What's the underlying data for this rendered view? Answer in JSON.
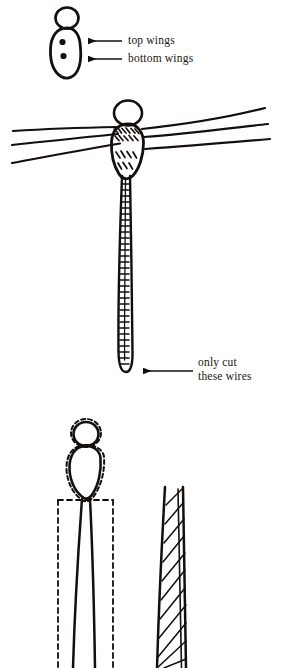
{
  "document": {
    "type": "hand-drawn instructional diagram",
    "background_color": "#ffffff",
    "ink_color": "#140f0c",
    "width": 283,
    "height": 668
  },
  "annotations": {
    "top_wings": {
      "text": "top wings",
      "arrow": "leftward-arrow-icon",
      "points_to": "upper dot on insect body"
    },
    "bottom_wings": {
      "text": "bottom wings",
      "arrow": "leftward-arrow-icon",
      "points_to": "lower dot on insect body"
    },
    "only_cut": {
      "line1": "only cut",
      "line2": "these wires",
      "arrow": "leftward-arrow-icon",
      "points_to": "bottom tip of the wrapped wire tail"
    }
  },
  "figures": [
    {
      "name": "figure-1-body-plan",
      "description": "Small insect body outline: round head above an elongated teardrop body containing two filled dots marking the top wing and bottom wing attachment points.",
      "parts": [
        "head-circle",
        "body-teardrop",
        "top-wing-dot",
        "bottom-wing-dot"
      ]
    },
    {
      "name": "figure-2-assembled-insect",
      "description": "Assembled figure: round head, body with hatched wire crossings, three long wires passing through on each side forming wings, and a long wrapped wire tail ending in a rounded tip.",
      "parts": [
        "head-circle",
        "body-oval",
        "wing-wire-left-1",
        "wing-wire-left-2",
        "wing-wire-left-3",
        "wing-wire-right-1",
        "wing-wire-right-2",
        "wing-wire-right-3",
        "wrapped-tail"
      ]
    },
    {
      "name": "figure-3-body-outline-with-cut-guide",
      "description": "Head and body drawn in solid outline with a dashed outline just outside it, sitting atop two near-parallel solid stem lines enclosed by a dashed rectangle indicating the cut guide.",
      "parts": [
        "head-circle",
        "body-oval",
        "dashed-outline",
        "stem-left",
        "stem-right",
        "dashed-cut-box"
      ]
    },
    {
      "name": "figure-4-wrapped-shaft",
      "description": "Tapered shaft formed by two long solid lines with diagonal hatching between them, representing wire wrapped around a core.",
      "parts": [
        "shaft-left-edge",
        "shaft-right-edge",
        "diagonal-wrap-hatching"
      ]
    }
  ]
}
